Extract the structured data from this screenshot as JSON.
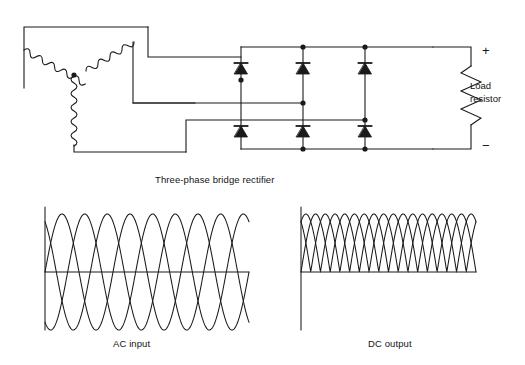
{
  "figure": {
    "background": "#ffffff",
    "line_color": "#1a1a1a",
    "stroke_width": 1.1
  },
  "captions": {
    "bridge": "Three-phase bridge rectifier",
    "ac_input": "AC input",
    "dc_output": "DC output"
  },
  "load": {
    "label_line1": "Load",
    "label_line2": "resistor",
    "plus": "+",
    "minus": "−"
  },
  "circuit": {
    "source_type": "wye-connected three-phase winding",
    "coils": 3,
    "diodes": 6,
    "diode_orientation": "anode-bottom cathode-top (pointing up)",
    "bridge_legs": 3,
    "nodes": 8
  },
  "chart_data": [
    {
      "type": "line",
      "title": "AC input",
      "name": "ac_input",
      "xlabel": "",
      "ylabel": "",
      "grid": false,
      "legend": false,
      "x_range": [
        0,
        3
      ],
      "ylim": [
        -1,
        1
      ],
      "baseline": 0,
      "cycles": 3,
      "series": [
        {
          "name": "Phase A",
          "phase_deg": 0,
          "amplitude": 1
        },
        {
          "name": "Phase B",
          "phase_deg": 120,
          "amplitude": 1
        },
        {
          "name": "Phase C",
          "phase_deg": 240,
          "amplitude": 1
        }
      ]
    },
    {
      "type": "line",
      "title": "DC output",
      "name": "dc_output",
      "xlabel": "",
      "ylabel": "",
      "grid": false,
      "legend": false,
      "x_range": [
        0,
        3
      ],
      "ylim": [
        0,
        1
      ],
      "baseline": 0,
      "cycles": 3,
      "series": [
        {
          "name": "Phase A rectified",
          "phase_deg": 0,
          "amplitude": 1,
          "rectified": true
        },
        {
          "name": "Phase B rectified",
          "phase_deg": 120,
          "amplitude": 1,
          "rectified": true
        },
        {
          "name": "Phase C rectified",
          "phase_deg": 240,
          "amplitude": 1,
          "rectified": true
        }
      ]
    }
  ]
}
